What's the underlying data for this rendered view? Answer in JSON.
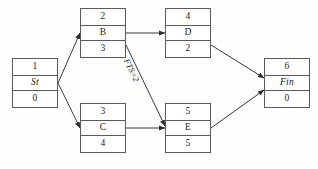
{
  "diagram": {
    "type": "activity-on-node-network",
    "canvas": {
      "width": 318,
      "height": 169
    },
    "colors": {
      "background": "#fdfdfc",
      "node_fill": "#ffffff",
      "node_border": "#5a5a5a",
      "edge": "#3a3a3a",
      "text": "#1a1a1a"
    },
    "nodes": [
      {
        "id": "start",
        "name": "node-start",
        "number": "1",
        "label": "St",
        "duration": "0",
        "italic_label": true,
        "x": 12,
        "y": 58,
        "w": 46,
        "h": 50
      },
      {
        "id": "b",
        "name": "node-b",
        "number": "2",
        "label": "B",
        "duration": "3",
        "italic_label": false,
        "x": 80,
        "y": 8,
        "w": 46,
        "h": 50
      },
      {
        "id": "d",
        "name": "node-d",
        "number": "4",
        "label": "D",
        "duration": "2",
        "italic_label": false,
        "x": 165,
        "y": 8,
        "w": 46,
        "h": 50
      },
      {
        "id": "c",
        "name": "node-c",
        "number": "3",
        "label": "C",
        "duration": "4",
        "italic_label": false,
        "x": 80,
        "y": 103,
        "w": 46,
        "h": 50
      },
      {
        "id": "e",
        "name": "node-e",
        "number": "5",
        "label": "E",
        "duration": "5",
        "italic_label": false,
        "x": 165,
        "y": 103,
        "w": 46,
        "h": 50
      },
      {
        "id": "fin",
        "name": "node-fin",
        "number": "6",
        "label": "Fin",
        "duration": "0",
        "italic_label": true,
        "x": 264,
        "y": 58,
        "w": 46,
        "h": 50
      }
    ],
    "edges": [
      {
        "id": "start-b",
        "from": "start",
        "to": "b",
        "x1": 58,
        "y1": 83,
        "x2": 80,
        "y2": 33,
        "label": ""
      },
      {
        "id": "start-c",
        "from": "start",
        "to": "c",
        "x1": 58,
        "y1": 83,
        "x2": 80,
        "y2": 128,
        "label": ""
      },
      {
        "id": "b-d",
        "from": "b",
        "to": "d",
        "x1": 126,
        "y1": 33,
        "x2": 165,
        "y2": 33,
        "label": ""
      },
      {
        "id": "b-e",
        "from": "b",
        "to": "e",
        "x1": 126,
        "y1": 45,
        "x2": 165,
        "y2": 126,
        "label": "FTS=2"
      },
      {
        "id": "c-e",
        "from": "c",
        "to": "e",
        "x1": 126,
        "y1": 128,
        "x2": 165,
        "y2": 128,
        "label": ""
      },
      {
        "id": "d-fin",
        "from": "d",
        "to": "fin",
        "x1": 211,
        "y1": 45,
        "x2": 264,
        "y2": 78,
        "label": ""
      },
      {
        "id": "e-fin",
        "from": "e",
        "to": "fin",
        "x1": 211,
        "y1": 128,
        "x2": 264,
        "y2": 90,
        "label": ""
      }
    ],
    "edge_labels": [
      {
        "id": "fts-label",
        "name": "edge-label-fts",
        "text": "FTS=2",
        "x": 131,
        "y": 57,
        "rotation": 64
      }
    ]
  }
}
